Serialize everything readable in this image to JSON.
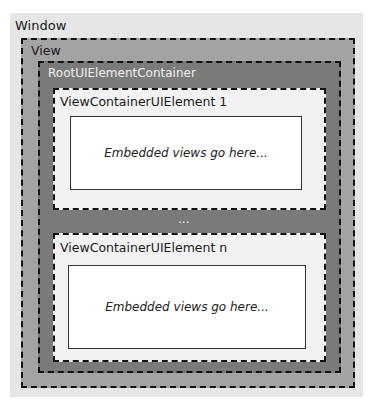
{
  "diagram": {
    "window": {
      "label": "Window"
    },
    "view": {
      "label": "View"
    },
    "root": {
      "label": "RootUIElementContainer"
    },
    "containers": [
      {
        "label": "ViewContainerUIElement 1",
        "embedded_text": "Embedded views go here..."
      },
      {
        "label": "ViewContainerUIElement n",
        "embedded_text": "Embedded views go here..."
      }
    ],
    "ellipsis": "..."
  }
}
